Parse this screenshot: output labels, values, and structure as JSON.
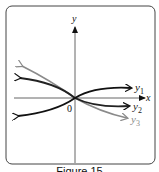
{
  "figure": {
    "caption": "Figure 15",
    "axes": {
      "x_label": "x",
      "y_label": "y",
      "origin_label": "0"
    },
    "curves": [
      {
        "name": "y1",
        "label_base": "y",
        "label_sub": "1",
        "color": "#111111"
      },
      {
        "name": "y2",
        "label_base": "y",
        "label_sub": "2",
        "color": "#222222"
      },
      {
        "name": "y3",
        "label_base": "y",
        "label_sub": "3",
        "color": "#8a8a8a"
      }
    ],
    "colors": {
      "frame": "#444444",
      "axis": "#555555",
      "background": "#ffffff"
    }
  }
}
